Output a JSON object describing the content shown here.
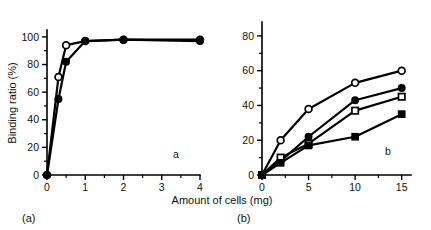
{
  "figure": {
    "background": "#ffffff",
    "ink_color": "#000000",
    "axis_title_x": "Amount of cells (mg)",
    "axis_title_y": "Binding ratio (%)",
    "caption_a": "(a)",
    "caption_b": "(b)",
    "panel_letter_a": "a",
    "panel_letter_b": "b"
  },
  "chart_data": [
    {
      "type": "line",
      "panel": "a",
      "title": "",
      "xlabel": "Amount of cells (mg)",
      "ylabel": "Binding ratio (%)",
      "xlim": [
        0,
        4
      ],
      "ylim": [
        0,
        105
      ],
      "xticks": [
        0,
        1,
        2,
        3,
        4
      ],
      "yticks": [
        0,
        20,
        40,
        60,
        80,
        100
      ],
      "xticklabels": [
        "0",
        "1",
        "2",
        "3",
        "4"
      ],
      "yticklabels": [
        "0",
        "20",
        "40",
        "60",
        "80",
        "100"
      ],
      "grid": false,
      "legend": "none",
      "annotation": "a",
      "series": [
        {
          "name": "open-circle",
          "marker": "open-circle",
          "x": [
            0,
            0.3,
            0.5,
            1,
            2,
            4
          ],
          "values": [
            0,
            71,
            94,
            97,
            98,
            98
          ]
        },
        {
          "name": "filled-circle",
          "marker": "filled-circle",
          "x": [
            0,
            0.3,
            0.5,
            1,
            2,
            4
          ],
          "values": [
            0,
            55,
            82,
            97,
            98,
            97
          ]
        }
      ]
    },
    {
      "type": "line",
      "panel": "b",
      "title": "",
      "xlabel": "Amount of cells (mg)",
      "ylabel": "Binding ratio (%)",
      "xlim": [
        0,
        16
      ],
      "ylim": [
        0,
        88
      ],
      "xticks": [
        0,
        5,
        10,
        15
      ],
      "yticks": [
        0,
        20,
        40,
        60,
        80
      ],
      "xticklabels": [
        "0",
        "5",
        "10",
        "15"
      ],
      "yticklabels": [
        "0",
        "20",
        "40",
        "60",
        "80"
      ],
      "grid": false,
      "legend": "none",
      "annotation": "b",
      "series": [
        {
          "name": "open-circle",
          "marker": "open-circle",
          "x": [
            0,
            2,
            5,
            10,
            15
          ],
          "values": [
            0,
            20,
            38,
            53,
            60
          ]
        },
        {
          "name": "filled-circle",
          "marker": "filled-circle",
          "x": [
            0,
            2,
            5,
            10,
            15
          ],
          "values": [
            0,
            8,
            22,
            43,
            50
          ]
        },
        {
          "name": "open-square",
          "marker": "open-square",
          "x": [
            0,
            2,
            5,
            10,
            15
          ],
          "values": [
            0,
            10,
            18,
            37,
            45
          ]
        },
        {
          "name": "filled-square",
          "marker": "filled-square",
          "x": [
            0,
            2,
            5,
            10,
            15
          ],
          "values": [
            0,
            7,
            17,
            22,
            35
          ]
        }
      ]
    }
  ]
}
